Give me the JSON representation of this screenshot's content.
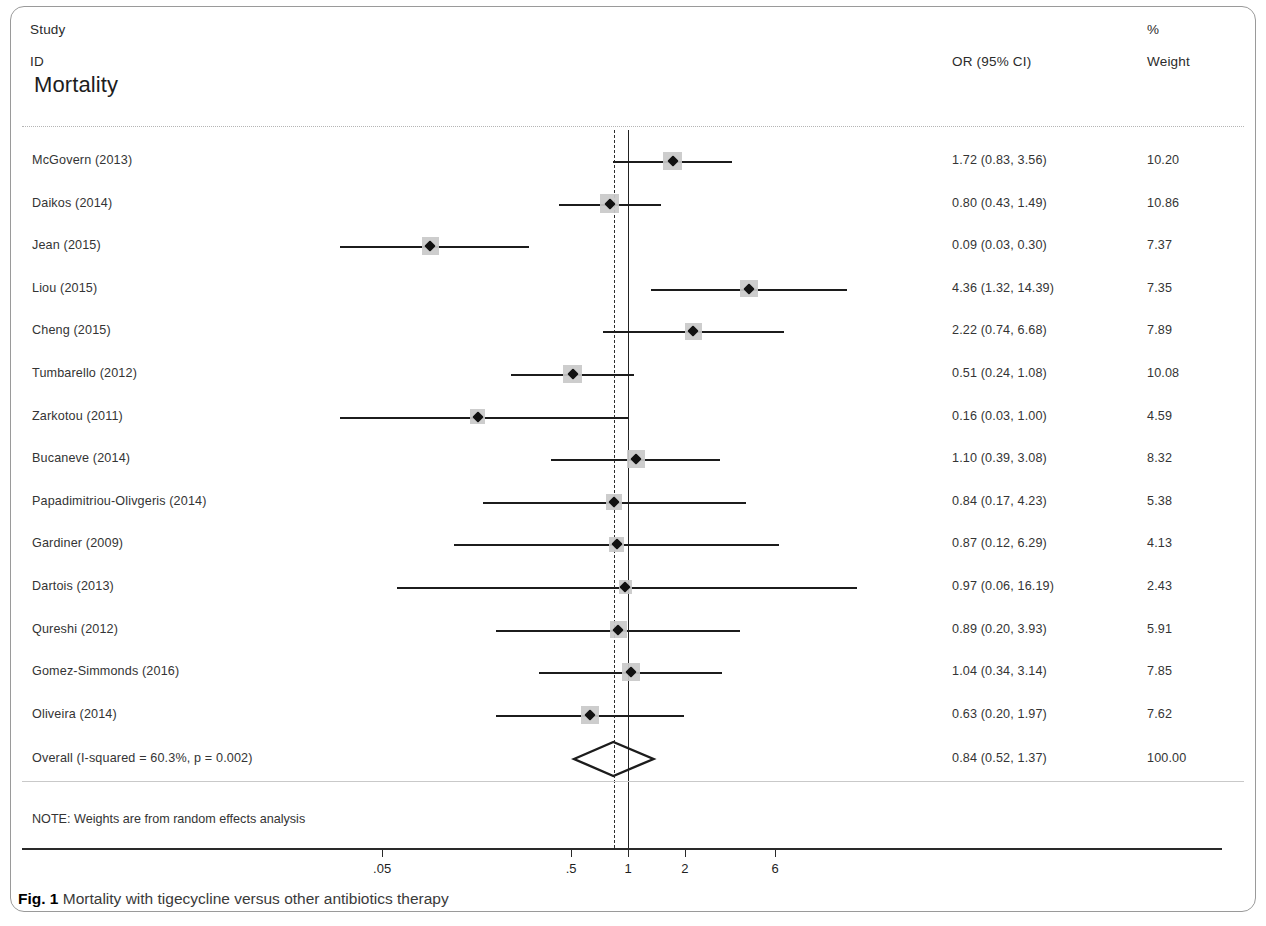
{
  "figure": {
    "caption_label": "Fig. 1",
    "caption_text": "Mortality with tigecycline versus other antibiotics therapy"
  },
  "header": {
    "study": "Study",
    "id": "ID",
    "or_header": "OR (95% CI)",
    "percent": "%",
    "weight": "Weight",
    "section_title": "Mortality"
  },
  "note": "NOTE: Weights are from random effects analysis",
  "colors": {
    "marker_box": "#c9c9c9",
    "line": "#1c1c1c",
    "null_line": "#222222",
    "pooled_line": "#2d2d2d",
    "text": "#343434"
  },
  "chart_data": {
    "type": "forest",
    "title": "Mortality",
    "xlabel": "",
    "ylabel": "",
    "x_scale": "log",
    "x_ticks": [
      0.05,
      0.5,
      1,
      2,
      6
    ],
    "x_tick_labels": [
      ".05",
      ".5",
      "1",
      "2",
      "6"
    ],
    "x_range": [
      0.03,
      17
    ],
    "null_value": 1,
    "pooled_value": 0.84,
    "effect_measure": "OR (95% CI)",
    "heterogeneity": "I-squared = 60.3%, p = 0.002",
    "weights_model": "random effects",
    "columns": [
      "Study ID",
      "OR (95% CI)",
      "% Weight"
    ],
    "studies": [
      {
        "label": "McGovern  (2013)",
        "or": 1.72,
        "lcl": 0.83,
        "ucl": 3.56,
        "or_text": "1.72 (0.83, 3.56)",
        "weight": 10.2,
        "weight_text": "10.20"
      },
      {
        "label": "Daikos (2014)",
        "or": 0.8,
        "lcl": 0.43,
        "ucl": 1.49,
        "or_text": "0.80 (0.43, 1.49)",
        "weight": 10.86,
        "weight_text": "10.86"
      },
      {
        "label": "Jean (2015)",
        "or": 0.09,
        "lcl": 0.03,
        "ucl": 0.3,
        "or_text": "0.09 (0.03, 0.30)",
        "weight": 7.37,
        "weight_text": "7.37"
      },
      {
        "label": "Liou (2015)",
        "or": 4.36,
        "lcl": 1.32,
        "ucl": 14.39,
        "or_text": "4.36 (1.32, 14.39)",
        "weight": 7.35,
        "weight_text": "7.35"
      },
      {
        "label": "Cheng (2015)",
        "or": 2.22,
        "lcl": 0.74,
        "ucl": 6.68,
        "or_text": "2.22 (0.74, 6.68)",
        "weight": 7.89,
        "weight_text": "7.89"
      },
      {
        "label": "Tumbarello (2012)",
        "or": 0.51,
        "lcl": 0.24,
        "ucl": 1.08,
        "or_text": "0.51 (0.24, 1.08)",
        "weight": 10.08,
        "weight_text": "10.08"
      },
      {
        "label": "Zarkotou  (2011)",
        "or": 0.16,
        "lcl": 0.03,
        "ucl": 1.0,
        "or_text": "0.16 (0.03, 1.00)",
        "weight": 4.59,
        "weight_text": "4.59"
      },
      {
        "label": "Bucaneve (2014)",
        "or": 1.1,
        "lcl": 0.39,
        "ucl": 3.08,
        "or_text": "1.10 (0.39, 3.08)",
        "weight": 8.32,
        "weight_text": "8.32"
      },
      {
        "label": "Papadimitriou-Olivgeris (2014)",
        "or": 0.84,
        "lcl": 0.17,
        "ucl": 4.23,
        "or_text": "0.84 (0.17, 4.23)",
        "weight": 5.38,
        "weight_text": "5.38"
      },
      {
        "label": "Gardiner (2009)",
        "or": 0.87,
        "lcl": 0.12,
        "ucl": 6.29,
        "or_text": "0.87 (0.12, 6.29)",
        "weight": 4.13,
        "weight_text": "4.13"
      },
      {
        "label": "Dartois (2013)",
        "or": 0.97,
        "lcl": 0.06,
        "ucl": 16.19,
        "or_text": "0.97 (0.06, 16.19)",
        "weight": 2.43,
        "weight_text": "2.43"
      },
      {
        "label": "Qureshi (2012)",
        "or": 0.89,
        "lcl": 0.2,
        "ucl": 3.93,
        "or_text": "0.89 (0.20, 3.93)",
        "weight": 5.91,
        "weight_text": "5.91"
      },
      {
        "label": "Gomez-Simmonds (2016)",
        "or": 1.04,
        "lcl": 0.34,
        "ucl": 3.14,
        "or_text": "1.04 (0.34, 3.14)",
        "weight": 7.85,
        "weight_text": "7.85"
      },
      {
        "label": "Oliveira (2014)",
        "or": 0.63,
        "lcl": 0.2,
        "ucl": 1.97,
        "or_text": "0.63 (0.20, 1.97)",
        "weight": 7.62,
        "weight_text": "7.62"
      }
    ],
    "overall": {
      "label": "Overall  (I-squared = 60.3%, p = 0.002)",
      "or": 0.84,
      "lcl": 0.52,
      "ucl": 1.37,
      "or_text": "0.84 (0.52, 1.37)",
      "weight": 100.0,
      "weight_text": "100.00"
    }
  }
}
